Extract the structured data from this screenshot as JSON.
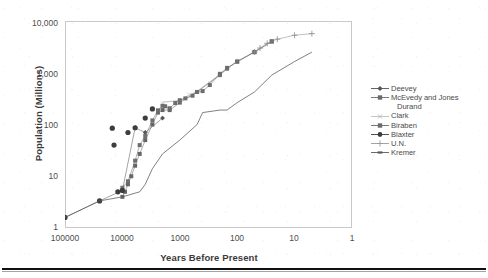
{
  "chart_data": {
    "type": "scatter",
    "title": "",
    "xlabel": "Years Before Present",
    "ylabel": "Population (Millions)",
    "xscale": "log",
    "yscale": "log",
    "x_reversed": true,
    "xlim": [
      100000,
      1
    ],
    "ylim": [
      1,
      10000
    ],
    "grid": false,
    "legend_position": "right",
    "xticks": [
      "100000",
      "10000",
      "1000",
      "100",
      "10",
      "1"
    ],
    "xtick_values": [
      100000,
      10000,
      1000,
      100,
      10,
      1
    ],
    "yticks": [
      "1",
      "10",
      "100",
      "1,000",
      "10,000"
    ],
    "ytick_values": [
      1,
      10,
      100,
      1000,
      10000
    ],
    "series": [
      {
        "name": "Deevey",
        "marker": "diamond",
        "color": "#555555",
        "points": [
          [
            1000000,
            0.125
          ],
          [
            300000,
            1.0
          ],
          [
            100000,
            1.6
          ],
          [
            25000,
            3.34
          ],
          [
            10000,
            5.32
          ],
          [
            6000,
            86.5
          ],
          [
            4000,
            70.0
          ],
          [
            2000,
            133.0
          ]
        ]
      },
      {
        "name": "McEvedy and Jones",
        "marker": "square",
        "color": "#666666",
        "points": [
          [
            10000,
            4.0
          ],
          [
            9000,
            5.0
          ],
          [
            8000,
            7.0
          ],
          [
            7000,
            10.0
          ],
          [
            6000,
            16.0
          ],
          [
            5000,
            27.0
          ],
          [
            4000,
            50.0
          ],
          [
            3000,
            100.0
          ],
          [
            2400,
            170.0
          ],
          [
            2000,
            190.0
          ],
          [
            1500,
            190.0
          ],
          [
            1000,
            265.0
          ],
          [
            500,
            425.0
          ],
          [
            200,
            900.0
          ],
          [
            150,
            1200.0
          ],
          [
            100,
            1650.0
          ],
          [
            50,
            2500.0
          ],
          [
            25,
            4000.0
          ]
        ]
      },
      {
        "name": "Durand",
        "marker": "none",
        "color": "#888888",
        "points": [
          [
            2000,
            270.0
          ],
          [
            1000,
            290.0
          ],
          [
            500,
            440.0
          ],
          [
            250,
            770.0
          ],
          [
            150,
            1200.0
          ],
          [
            100,
            1650.0
          ],
          [
            50,
            2520.0
          ]
        ]
      },
      {
        "name": "Clark",
        "marker": "x",
        "color": "#b5b5b5",
        "points": [
          [
            2000,
            255.0
          ],
          [
            1500,
            206.0
          ],
          [
            1000,
            280.0
          ],
          [
            700,
            384.0
          ],
          [
            500,
            427.0
          ],
          [
            300,
            641.0
          ],
          [
            200,
            900.0
          ],
          [
            150,
            1171.0
          ],
          [
            100,
            1608.0
          ],
          [
            50,
            2400.0
          ]
        ]
      },
      {
        "name": "Biraben",
        "marker": "square",
        "color": "#6e6e6e",
        "points": [
          [
            10000,
            6.0
          ],
          [
            8000,
            8.0
          ],
          [
            6000,
            20.0
          ],
          [
            5000,
            40.0
          ],
          [
            4000,
            60.0
          ],
          [
            3000,
            120.0
          ],
          [
            2400,
            188.0
          ],
          [
            2000,
            230.0
          ],
          [
            1800,
            225.0
          ],
          [
            1500,
            206.0
          ],
          [
            1200,
            260.0
          ],
          [
            1000,
            295.0
          ],
          [
            800,
            320.0
          ],
          [
            600,
            360.0
          ],
          [
            500,
            425.0
          ],
          [
            400,
            442.0
          ],
          [
            300,
            579.0
          ],
          [
            200,
            954.0
          ],
          [
            150,
            1241.0
          ],
          [
            100,
            1634.0
          ],
          [
            50,
            2526.0
          ],
          [
            25,
            4070.0
          ]
        ]
      },
      {
        "name": "Blaxter",
        "marker": "circle",
        "color": "#3d3d3d",
        "points": [
          [
            100000,
            1.6
          ],
          [
            25000,
            3.34
          ],
          [
            12000,
            5.0
          ],
          [
            10000,
            5.32
          ],
          [
            15000,
            85.0
          ],
          [
            8000,
            70.0
          ],
          [
            14000,
            40.0
          ],
          [
            6000,
            86.5
          ],
          [
            4000,
            133.0
          ],
          [
            3000,
            200.0
          ]
        ]
      },
      {
        "name": "U.N.",
        "marker": "plus",
        "color": "#8a8a8a",
        "points": [
          [
            50,
            2519.0
          ],
          [
            40,
            3000.0
          ],
          [
            30,
            3700.0
          ],
          [
            20,
            4450.0
          ],
          [
            10,
            5300.0
          ],
          [
            5,
            5700.0
          ]
        ]
      },
      {
        "name": "Kremer",
        "marker": "line",
        "color": "#5a5a5a",
        "points": [
          [
            1000000,
            0.125
          ],
          [
            300000,
            1.0
          ],
          [
            100000,
            1.6
          ],
          [
            25000,
            3.34
          ],
          [
            10000,
            4.0
          ],
          [
            5000,
            5.0
          ],
          [
            4000,
            7.0
          ],
          [
            3000,
            14.0
          ],
          [
            2000,
            27.0
          ],
          [
            1000,
            50.0
          ],
          [
            500,
            100.0
          ],
          [
            400,
            170.0
          ],
          [
            200,
            190.0
          ],
          [
            150,
            190.0
          ],
          [
            100,
            265.0
          ],
          [
            50,
            425.0
          ],
          [
            25,
            900.0
          ],
          [
            10,
            1650.0
          ],
          [
            5,
            2500.0
          ]
        ]
      }
    ],
    "curve_note": "Composite world population estimates on log-log axes; main envelope rises from ~1.6 million at 100,000 BP to ~6,000 million at ~5 BP.",
    "outliers": [
      {
        "x": 15000,
        "y": 85,
        "series": "Blaxter"
      },
      {
        "x": 8000,
        "y": 70,
        "series": "Blaxter"
      },
      {
        "x": 14000,
        "y": 40,
        "series": "Blaxter"
      }
    ]
  },
  "axes": {
    "ylabel": "Population (Millions)",
    "xlabel": "Years Before Present",
    "yticks": [
      {
        "label": "10,000",
        "top": 17.5
      },
      {
        "label": "1,000",
        "top": 68.5
      },
      {
        "label": "100",
        "top": 119.5
      },
      {
        "label": "10",
        "top": 170.5
      },
      {
        "label": "1",
        "top": 221.5
      }
    ],
    "xticks": [
      {
        "label": "100000",
        "left": 40
      },
      {
        "label": "10000",
        "left": 97
      },
      {
        "label": "1000",
        "left": 155
      },
      {
        "label": "100",
        "left": 212
      },
      {
        "label": "10",
        "left": 269
      },
      {
        "label": "1",
        "left": 327
      }
    ]
  },
  "legend": {
    "items": [
      {
        "label": "Deevey",
        "marker": "diamond",
        "color": "#555555",
        "indent": false
      },
      {
        "label": "McEvedy and Jones",
        "marker": "square",
        "color": "#6b6b6b",
        "indent": false
      },
      {
        "label": "Durand",
        "marker": "none",
        "color": "#8a8a8a",
        "indent": true
      },
      {
        "label": "Clark",
        "marker": "x",
        "color": "#bdbdbd",
        "indent": false
      },
      {
        "label": "Biraben",
        "marker": "square",
        "color": "#6b6b6b",
        "indent": false
      },
      {
        "label": "Blaxter",
        "marker": "circle",
        "color": "#3d3d3d",
        "indent": false
      },
      {
        "label": "U.N.",
        "marker": "plus",
        "color": "#9a9a9a",
        "indent": false
      },
      {
        "label": "Kremer",
        "marker": "dash",
        "color": "#5a5a5a",
        "indent": false
      }
    ]
  }
}
